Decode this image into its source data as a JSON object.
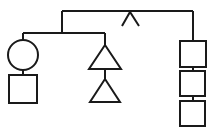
{
  "canvas": {
    "width": 208,
    "height": 128,
    "background_color": "#ffffff",
    "stroke_color": "#1a1a1a",
    "stroke_width": 2,
    "title": "Kinship Diagram"
  },
  "diagram": {
    "type": "kinship-chart",
    "orientation": "top-down",
    "nodes": [
      {
        "id": "left-circle",
        "shape": "circle",
        "label": "",
        "cx": 23,
        "cy": 55,
        "r": 15,
        "branch": "left"
      },
      {
        "id": "left-square",
        "shape": "square",
        "label": "",
        "x": 9,
        "y": 75,
        "size": 28,
        "branch": "left"
      },
      {
        "id": "middle-triangle-upper",
        "shape": "triangle",
        "label": "",
        "apex_x": 105,
        "apex_y": 45,
        "base_y": 69,
        "half_width": 16,
        "branch": "middle"
      },
      {
        "id": "middle-triangle-lower",
        "shape": "triangle",
        "label": "",
        "apex_x": 105,
        "apex_y": 79,
        "base_y": 102,
        "half_width": 15,
        "branch": "middle"
      },
      {
        "id": "right-square-top",
        "shape": "square",
        "label": "",
        "x": 180,
        "y": 41,
        "size": 26,
        "branch": "right"
      },
      {
        "id": "right-square-middle",
        "shape": "square",
        "label": "",
        "x": 180,
        "y": 71,
        "size": 25,
        "branch": "right"
      },
      {
        "id": "right-square-bottom",
        "shape": "square",
        "label": "",
        "x": 180,
        "y": 101,
        "size": 25,
        "branch": "right"
      }
    ],
    "links": [
      {
        "id": "top-horizontal-bar",
        "from": "top-left-corner",
        "to": "top-right-corner",
        "path": "M 62 11 L 193 11"
      },
      {
        "id": "top-left-drop",
        "from": "top-horizontal-bar",
        "to": "branch-bar",
        "path": "M 62 11 L 62 33"
      },
      {
        "id": "top-right-drop",
        "from": "top-horizontal-bar",
        "to": "right-square-top",
        "path": "M 193 11 L 193 41"
      },
      {
        "id": "branch-bar",
        "from": "left-drop",
        "to": "middle-drop",
        "path": "M 23 33 L 105 33"
      },
      {
        "id": "left-drop",
        "from": "branch-bar",
        "to": "left-circle",
        "path": "M 23 33 L 23 40"
      },
      {
        "id": "left-circle-to-square",
        "from": "left-circle",
        "to": "left-square",
        "path": "M 23 70 L 23 75"
      },
      {
        "id": "middle-drop",
        "from": "branch-bar",
        "to": "middle-triangle-upper",
        "path": "M 105 33 L 105 45"
      },
      {
        "id": "middle-triangle-connector",
        "from": "middle-triangle-upper",
        "to": "middle-triangle-lower",
        "path": "M 105 69 L 105 79"
      },
      {
        "id": "right-square-top-to-middle",
        "from": "right-square-top",
        "to": "right-square-middle",
        "path": "M 193 66 L 193 71"
      },
      {
        "id": "right-square-middle-to-bottom",
        "from": "right-square-middle",
        "to": "right-square-bottom",
        "path": "M 193 96 L 193 101"
      }
    ],
    "marks": [
      {
        "id": "caret-mark",
        "glyph": "caret",
        "symbol": "^",
        "apex_x": 130,
        "apex_y": 12,
        "left_x": 122,
        "right_x": 139,
        "foot_y": 26
      }
    ]
  }
}
